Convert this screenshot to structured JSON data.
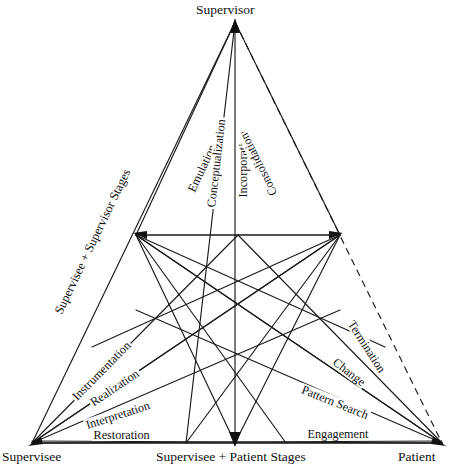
{
  "figure": {
    "type": "triangular-stage-model-diagram",
    "background_color": "#ffffff",
    "line_color": "#1a1a1a"
  },
  "vertices": [
    {
      "id": "supervisor",
      "label": "Supervisor",
      "x": 235,
      "y": 22
    },
    {
      "id": "supervisee",
      "label": "Supervisee",
      "x": 32,
      "y": 443
    },
    {
      "id": "patient",
      "label": "Patient",
      "x": 442,
      "y": 443
    },
    {
      "id": "mid-left",
      "label": "Supervisee + Supervisor Stages",
      "x": 136,
      "y": 235
    },
    {
      "id": "mid-right",
      "label": "",
      "x": 340,
      "y": 235
    },
    {
      "id": "bottom-mid",
      "label": "Supervisee + Patient Stages",
      "x": 235,
      "y": 443
    }
  ],
  "axis_labels": [
    {
      "id": "supervisor-label",
      "text": "Supervisor",
      "position": "top-center"
    },
    {
      "id": "supervisee-label",
      "text": "Supervisee",
      "position": "bottom-left"
    },
    {
      "id": "patient-label",
      "text": "Patient",
      "position": "bottom-right"
    },
    {
      "id": "supervisee-patient-label",
      "text": "Supervisee + Patient Stages",
      "position": "bottom-center"
    },
    {
      "id": "supervisee-supervisor-label",
      "text": "Supervisee + Supervisor Stages",
      "position": "left-edge-rotated"
    }
  ],
  "stage_labels": {
    "supervisor_stages": [
      {
        "id": "emulation",
        "text": "Emulation",
        "angle": -77
      },
      {
        "id": "conceptualization",
        "text": "Conceptualization",
        "angle": -83
      },
      {
        "id": "incorporation",
        "text": "Incorporation",
        "angle": -90
      },
      {
        "id": "consolidation",
        "text": "Consolidation",
        "angle": -104
      }
    ],
    "supervisee_stages": [
      {
        "id": "instrumentation",
        "text": "Instrumentation",
        "angle": -46
      },
      {
        "id": "realization",
        "text": "Realization",
        "angle": -33
      },
      {
        "id": "interpretation",
        "text": "Interpretation",
        "angle": -20
      },
      {
        "id": "restoration",
        "text": "Restoration",
        "angle": 0
      }
    ],
    "patient_stages": [
      {
        "id": "termination",
        "text": "Termination",
        "angle": 57
      },
      {
        "id": "change",
        "text": "Change",
        "angle": 38
      },
      {
        "id": "pattern-search",
        "text": "Pattern Search",
        "angle": 22
      },
      {
        "id": "engagement",
        "text": "Engagement",
        "angle": 0
      }
    ]
  },
  "edges": {
    "dashed": [
      {
        "from": "supervisor",
        "to": "patient",
        "label": "Termination-outer-boundary"
      }
    ],
    "outer_solid": [
      {
        "from": "supervisor",
        "to": "supervisee"
      },
      {
        "from": "supervisee",
        "to": "patient"
      }
    ]
  }
}
